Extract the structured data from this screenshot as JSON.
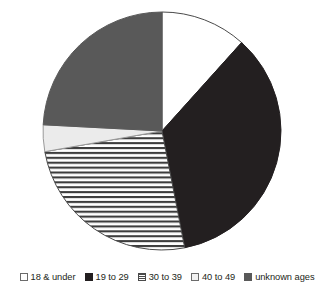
{
  "chart_data": {
    "type": "pie",
    "title": "",
    "subtitle": "",
    "xlabel": "",
    "ylabel": "",
    "legend_position": "bottom",
    "grid": false,
    "start_angle_deg": 0,
    "direction": "clockwise",
    "categories": [
      "18 & under",
      "19 to 29",
      "30 to 39",
      "40 to 49",
      "unknown ages"
    ],
    "values": [
      11.7,
      35.3,
      25.3,
      3.6,
      24.2
    ],
    "slices": [
      {
        "label": "18 & under",
        "value": 11.7,
        "start_angle_deg": 0,
        "end_angle_deg": 42,
        "sweep_deg": 42,
        "fill": "#ffffff",
        "pattern": "solid",
        "stroke": "#4a4a4a"
      },
      {
        "label": "19 to 29",
        "value": 35.3,
        "start_angle_deg": 42,
        "end_angle_deg": 169,
        "sweep_deg": 127,
        "fill": "#231f20",
        "pattern": "solid",
        "stroke": "#231f20"
      },
      {
        "label": "30 to 39",
        "value": 25.3,
        "start_angle_deg": 169,
        "end_angle_deg": 260,
        "sweep_deg": 91,
        "fill": "#ffffff",
        "pattern": "horizontal-stripes",
        "stroke": "#4a4a4a"
      },
      {
        "label": "40 to 49",
        "value": 3.6,
        "start_angle_deg": 260,
        "end_angle_deg": 273,
        "sweep_deg": 13,
        "fill": "#ebebeb",
        "pattern": "solid",
        "stroke": "#9a9a9a"
      },
      {
        "label": "unknown ages",
        "value": 24.2,
        "start_angle_deg": 273,
        "end_angle_deg": 360,
        "sweep_deg": 87,
        "fill": "#595959",
        "pattern": "solid",
        "stroke": "#595959"
      }
    ],
    "geometry": {
      "center_x": 162,
      "center_y": 131,
      "radius": 119
    }
  },
  "legend": {
    "items": [
      {
        "label": "18 & under",
        "swatch": "white-swatch",
        "color": "#ffffff"
      },
      {
        "label": "19 to 29",
        "swatch": "black-swatch",
        "color": "#231f20"
      },
      {
        "label": "30 to 39",
        "swatch": "gray-striped-swatch",
        "color": "#8a8a8a"
      },
      {
        "label": "40 to 49",
        "swatch": "light-gray-swatch",
        "color": "#f2f2f2"
      },
      {
        "label": "unknown ages",
        "swatch": "dark-gray-swatch",
        "color": "#595959"
      }
    ]
  }
}
